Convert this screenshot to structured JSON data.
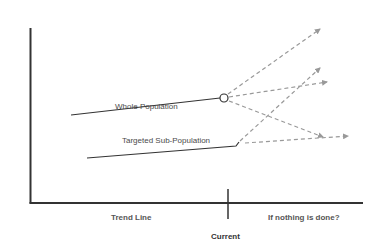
{
  "diagram": {
    "type": "trend-projection",
    "series": [
      {
        "name": "Whole Population",
        "label": "Whole Population",
        "trend": {
          "from": [
            71,
            115
          ],
          "to": [
            224,
            98
          ]
        },
        "marker": "circle",
        "projections": [
          {
            "to": [
              320,
              29
            ],
            "direction": "up"
          },
          {
            "to": [
              327,
              82
            ],
            "direction": "slight-up"
          },
          {
            "to": [
              323,
              137
            ],
            "direction": "down"
          }
        ]
      },
      {
        "name": "Targeted Sub-Population",
        "label": "Targeted Sub-Population",
        "trend": {
          "from": [
            87,
            158
          ],
          "to": [
            237,
            146
          ]
        },
        "marker": "none",
        "projections": [
          {
            "to": [
              320,
              68
            ],
            "direction": "up-steep"
          },
          {
            "to": [
              348,
              136
            ],
            "direction": "flat"
          }
        ]
      }
    ],
    "axis": {
      "x_labels": {
        "left": "Trend Line",
        "center": "Current",
        "right": "If nothing is done?"
      }
    },
    "colors": {
      "axis": "#333333",
      "trend_line": "#333333",
      "projection": "#999999",
      "text": "#4a4a4a"
    }
  }
}
